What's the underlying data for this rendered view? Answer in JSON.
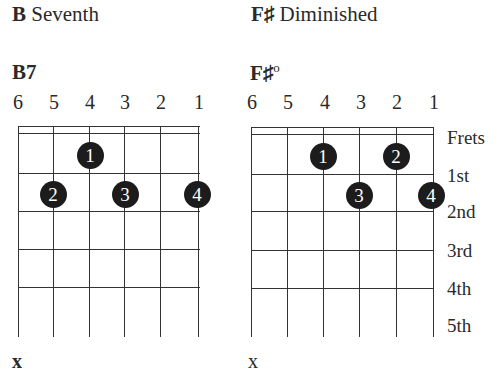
{
  "diagrams": [
    {
      "title_letter": "B",
      "title_rest": " Seventh",
      "chord_name": "B7",
      "chord_suffix": "",
      "string_numbers": [
        "6",
        "5",
        "4",
        "3",
        "2",
        "1"
      ],
      "fingers": [
        {
          "label": "1",
          "string": 4,
          "fret": 1
        },
        {
          "label": "2",
          "string": 5,
          "fret": 2
        },
        {
          "label": "3",
          "string": 3,
          "fret": 2
        },
        {
          "label": "4",
          "string": 1,
          "fret": 2
        }
      ],
      "muted_marker": "x",
      "muted_string": 6
    },
    {
      "title_letter": "F♯",
      "title_rest": " Diminished",
      "chord_name": "F♯",
      "chord_suffix": "o",
      "string_numbers": [
        "6",
        "5",
        "4",
        "3",
        "2",
        "1"
      ],
      "fingers": [
        {
          "label": "1",
          "string": 4,
          "fret": 1
        },
        {
          "label": "2",
          "string": 2,
          "fret": 1
        },
        {
          "label": "3",
          "string": 3,
          "fret": 2
        },
        {
          "label": "4",
          "string": 1,
          "fret": 2
        }
      ],
      "muted_marker": "x",
      "muted_string": 6
    }
  ],
  "fret_labels": [
    "Frets",
    "1st",
    "2nd",
    "3rd",
    "4th",
    "5th"
  ]
}
